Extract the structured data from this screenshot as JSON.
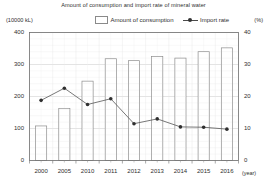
{
  "chart_data": {
    "type": "bar",
    "title": "Amount of consumption and import rate of mineral water",
    "xlabel": "(year)",
    "ylabel": "(10000 kL)",
    "y2label": "(%)",
    "categories": [
      "2000",
      "2005",
      "2010",
      "2011",
      "2012",
      "2013",
      "2014",
      "2015",
      "2016"
    ],
    "ylim": [
      0,
      400
    ],
    "y2lim": [
      0,
      40
    ],
    "yticks": [
      "0",
      "100",
      "200",
      "300",
      "400"
    ],
    "y2ticks": [
      "0",
      "10",
      "20",
      "30",
      "40"
    ],
    "grid": true,
    "legend_position": "top-center",
    "series": [
      {
        "name": "Amount of consumption",
        "type": "bar",
        "axis": "left",
        "values": [
          108,
          163,
          248,
          318,
          312,
          325,
          320,
          340,
          352
        ]
      },
      {
        "name": "Import rate",
        "type": "line",
        "axis": "right",
        "values": [
          18.8,
          22.6,
          17.5,
          19.3,
          11.5,
          13.0,
          10.5,
          10.4,
          9.8
        ]
      }
    ]
  },
  "legend": {
    "bar_label": "Amount of consumption",
    "line_label": "Import rate"
  }
}
